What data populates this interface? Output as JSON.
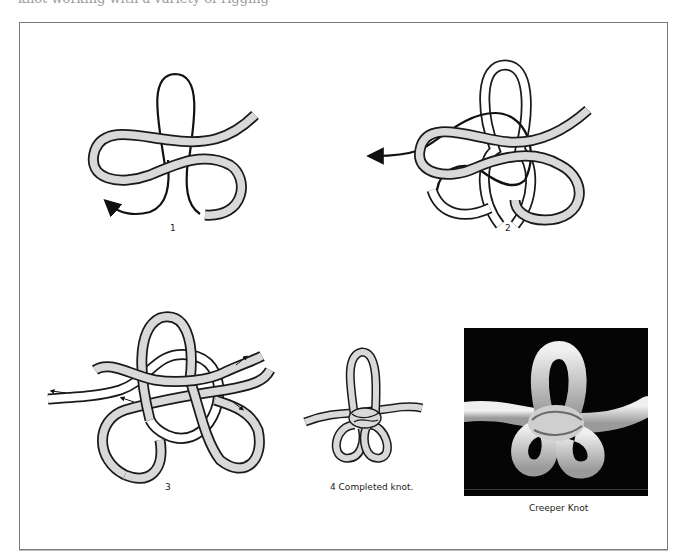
{
  "page": {
    "cut_off_heading": "knot working with a variety of rigging"
  },
  "figure": {
    "title": "Creeper Knot",
    "steps": [
      {
        "id": "1",
        "label": "1"
      },
      {
        "id": "2",
        "label": "2"
      },
      {
        "id": "3",
        "label": "3"
      },
      {
        "id": "4",
        "label": "4  Completed knot."
      }
    ],
    "photo_caption": "Creeper Knot"
  },
  "colors": {
    "rope_fill": "#d9d9d9",
    "rope_outline": "#1a1a1a",
    "working_end": "#111111",
    "photo_background": "#050505",
    "frame_border": "#7a7a7a"
  }
}
